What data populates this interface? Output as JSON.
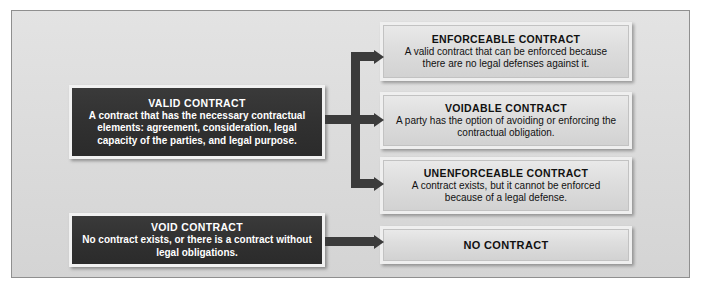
{
  "figure": {
    "kind": "flow-diagram",
    "panel_background": "#dcdcdc",
    "panel_border_color": "#8f8f8f",
    "dark_node_color": "#313131",
    "light_node_color": "#dedede",
    "connector_color": "#3b3b3b",
    "text_light": "#ffffff",
    "text_dark": "#111111"
  },
  "nodes": {
    "valid_contract": {
      "title": "VALID CONTRACT",
      "body": "A contract that has the necessary contractual elements: agreement, consideration, legal capacity of the parties, and legal purpose."
    },
    "void_contract": {
      "title": "VOID CONTRACT",
      "body": "No contract exists, or there is a contract without legal obligations."
    },
    "enforceable_contract": {
      "title": "ENFORCEABLE CONTRACT",
      "body": "A valid contract that can be enforced because there are no legal defenses against it."
    },
    "voidable_contract": {
      "title": "VOIDABLE CONTRACT",
      "body": "A party has the option of avoiding or enforcing the contractual obligation."
    },
    "unenforceable_contract": {
      "title": "UNENFORCEABLE CONTRACT",
      "body": "A contract exists, but it cannot be enforced because of a legal defense."
    },
    "no_contract": {
      "title": "NO CONTRACT",
      "body": ""
    }
  },
  "connectors": [
    {
      "name": "valid-to-branch-stub",
      "from": "valid_contract",
      "to": "branch-spine"
    },
    {
      "name": "branch-to-enforceable",
      "from": "branch-spine",
      "to": "enforceable_contract"
    },
    {
      "name": "branch-to-voidable",
      "from": "branch-spine",
      "to": "voidable_contract"
    },
    {
      "name": "branch-to-unenforceable",
      "from": "branch-spine",
      "to": "unenforceable_contract"
    },
    {
      "name": "void-to-no-contract",
      "from": "void_contract",
      "to": "no_contract"
    }
  ]
}
